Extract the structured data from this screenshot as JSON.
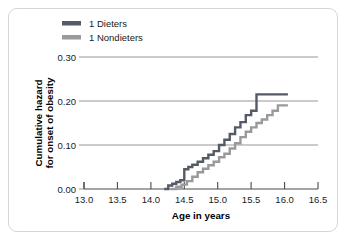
{
  "chart_data": {
    "type": "line",
    "title": "",
    "xlabel": "Age in years",
    "ylabel": "Cumulative hazard for onset of obesity",
    "ylabel_line1": "Cumulative hazard",
    "ylabel_line2": "for onset of obesity",
    "xlim": [
      13.0,
      16.5
    ],
    "ylim": [
      0.0,
      0.3
    ],
    "xticks": [
      13.0,
      13.5,
      14.0,
      14.5,
      15.0,
      15.5,
      16.0,
      16.5
    ],
    "xticklabels": [
      "13.0",
      "13.5",
      "14.0",
      "14.5",
      "15.0",
      "15.5",
      "16.0",
      "16.5"
    ],
    "yticks": [
      0.0,
      0.1,
      0.2,
      0.3
    ],
    "yticklabels": [
      "0.00",
      "0.10",
      "0.20",
      "0.30"
    ],
    "grid": "horizontal",
    "legend_position": "top-left",
    "step_type": "post",
    "series": [
      {
        "name": "1 Dieters",
        "color": "#545b66",
        "x": [
          14.2,
          14.26,
          14.32,
          14.38,
          14.44,
          14.5,
          14.56,
          14.62,
          14.7,
          14.78,
          14.86,
          14.94,
          15.02,
          15.1,
          15.18,
          15.26,
          15.34,
          15.42,
          15.5,
          15.58,
          16.05
        ],
        "y": [
          0.0,
          0.008,
          0.012,
          0.016,
          0.02,
          0.045,
          0.05,
          0.055,
          0.062,
          0.07,
          0.078,
          0.086,
          0.1,
          0.112,
          0.125,
          0.14,
          0.152,
          0.168,
          0.178,
          0.215,
          0.215
        ]
      },
      {
        "name": "1 Nondieters",
        "color": "#9a9a9a",
        "x": [
          14.3,
          14.38,
          14.46,
          14.54,
          14.62,
          14.7,
          14.78,
          14.86,
          14.94,
          15.02,
          15.1,
          15.18,
          15.26,
          15.34,
          15.42,
          15.5,
          15.58,
          15.66,
          15.74,
          15.82,
          15.9,
          16.05
        ],
        "y": [
          0.0,
          0.005,
          0.01,
          0.018,
          0.028,
          0.038,
          0.046,
          0.054,
          0.062,
          0.072,
          0.08,
          0.092,
          0.104,
          0.118,
          0.13,
          0.14,
          0.15,
          0.158,
          0.168,
          0.178,
          0.19,
          0.19
        ]
      }
    ]
  },
  "legend": {
    "items": [
      {
        "label": "1 Dieters",
        "color": "#545b66"
      },
      {
        "label": "1 Nondieters",
        "color": "#9a9a9a"
      }
    ]
  },
  "colors": {
    "dieters": "#545b66",
    "nondieters": "#9a9a9a",
    "grid": "#6b6b6b",
    "axis": "#4a4a4a",
    "border": "#d6d6d6",
    "text": "#1a1a1a"
  }
}
